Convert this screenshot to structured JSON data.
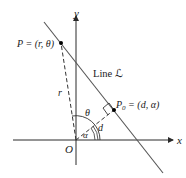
{
  "diagram": {
    "type": "polar-line-geometry",
    "axes": {
      "x_label": "x",
      "y_label": "y",
      "origin_label": "O"
    },
    "line_label": "Line ℒ",
    "points": {
      "P": {
        "label": "P = (r, θ)"
      },
      "P0": {
        "label_main": "P",
        "label_sub": "0",
        "label_rest": " = (d, α)"
      }
    },
    "segment_labels": {
      "r": "r",
      "d": "d"
    },
    "angle_labels": {
      "theta": "θ",
      "alpha": "α"
    },
    "colors": {
      "axis": "#2a2a2a",
      "line": "#555555",
      "dashed": "#333333",
      "point": "#000000"
    }
  }
}
